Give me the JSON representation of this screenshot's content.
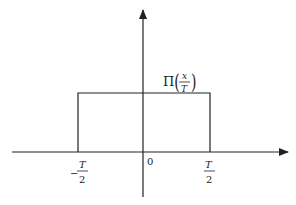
{
  "diagram": {
    "function_label": {
      "prefix": "Π",
      "numerator": "x",
      "denominator": "T"
    },
    "x_ticks": [
      {
        "sign": "−",
        "numerator": "T",
        "denominator": "2"
      },
      {
        "label": "0"
      },
      {
        "sign": "",
        "numerator": "T",
        "denominator": "2"
      }
    ],
    "colors": {
      "stroke": "#222222",
      "background": "#ffffff"
    }
  }
}
